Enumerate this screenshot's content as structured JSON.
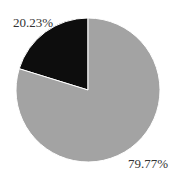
{
  "chart_data": {
    "type": "pie",
    "title": "",
    "categories": [
      "Slice A",
      "Slice B"
    ],
    "values": [
      20.23,
      79.77
    ],
    "labels": [
      "20.23%",
      "79.77%"
    ],
    "colors": [
      "#0d0d0d",
      "#a3a3a3"
    ],
    "legend": "none",
    "start_angle_deg": 90,
    "direction": "counterclockwise"
  },
  "labels": {
    "small": "20.23%",
    "large": "79.77%"
  }
}
